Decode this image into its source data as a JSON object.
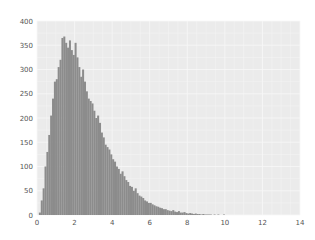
{
  "chart_data": {
    "type": "bar",
    "title": "",
    "xlabel": "",
    "ylabel": "",
    "xlim": [
      0,
      14
    ],
    "ylim": [
      0,
      400
    ],
    "grid": true,
    "legend": null,
    "xticks": [
      "0",
      "2",
      "4",
      "6",
      "8",
      "10",
      "12",
      "14"
    ],
    "yticks": [
      "0",
      "50",
      "100",
      "150",
      "200",
      "250",
      "300",
      "350",
      "400"
    ],
    "bin_width": 0.1,
    "bin_start": 0.1,
    "values": [
      5,
      30,
      55,
      100,
      130,
      165,
      205,
      240,
      275,
      280,
      305,
      320,
      365,
      368,
      355,
      345,
      360,
      340,
      330,
      355,
      325,
      305,
      285,
      300,
      275,
      255,
      240,
      235,
      230,
      215,
      200,
      205,
      190,
      170,
      160,
      145,
      140,
      135,
      125,
      115,
      110,
      100,
      95,
      85,
      90,
      80,
      72,
      68,
      60,
      58,
      50,
      55,
      45,
      40,
      38,
      35,
      30,
      28,
      25,
      25,
      22,
      20,
      18,
      17,
      15,
      14,
      12,
      12,
      10,
      9,
      8,
      10,
      7,
      6,
      8,
      5,
      5,
      6,
      4,
      3,
      4,
      3,
      2,
      3,
      2,
      2,
      1,
      2,
      1,
      1,
      1,
      1,
      0,
      1,
      0,
      1,
      0,
      0,
      1,
      0
    ],
    "colors": {
      "bar": "#8c8c8c",
      "background": "#ebebeb",
      "grid": "#f7f7f7",
      "tick_label": "#555555"
    }
  }
}
